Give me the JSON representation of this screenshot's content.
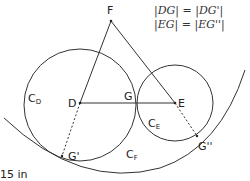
{
  "equations": [
    "|DG| = |DG'|",
    "|EG| = |EG''|"
  ],
  "points": {
    "F": {
      "label": "F",
      "x": 111,
      "y": 20
    },
    "D": {
      "label": "D",
      "x": 80,
      "y": 103
    },
    "G": {
      "label": "G",
      "x": 137,
      "y": 103
    },
    "E": {
      "label": "E",
      "x": 175,
      "y": 103
    },
    "G1": {
      "label": "G'",
      "x": 62,
      "y": 156
    },
    "G2": {
      "label": "G''",
      "x": 197,
      "y": 136
    }
  },
  "circles": {
    "CD": {
      "label": "C",
      "sub": "D"
    },
    "CE": {
      "label": "C",
      "sub": "E"
    },
    "CF": {
      "label": "C",
      "sub": "F"
    }
  },
  "caption": "15 in"
}
